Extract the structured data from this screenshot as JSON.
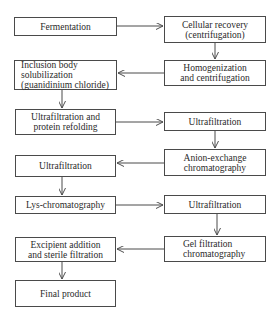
{
  "diagram": {
    "type": "flowchart",
    "nodes": [
      {
        "id": "fermentation",
        "label": "Fermentation"
      },
      {
        "id": "cellular_recovery",
        "label": "Cellular recovery\n(centrifugation)"
      },
      {
        "id": "homogenization",
        "label": "Homogenization\nand centrifugation"
      },
      {
        "id": "inclusion_body",
        "label": "Inclusion body\nsolubilization\n(guanidinium chloride)"
      },
      {
        "id": "uf_refolding",
        "label": "Ultrafiltration and\nprotein refolding"
      },
      {
        "id": "uf_2",
        "label": "Ultrafiltration"
      },
      {
        "id": "anion_exchange",
        "label": "Anion-exchange\nchromatography"
      },
      {
        "id": "uf_3",
        "label": "Ultrafiltration"
      },
      {
        "id": "lys_chrom",
        "label": "Lys-chromatography"
      },
      {
        "id": "uf_4",
        "label": "Ultrafiltration"
      },
      {
        "id": "gel_filtration",
        "label": "Gel filtration\nchromatography"
      },
      {
        "id": "excipient",
        "label": "Excipient addition\nand sterile filtration"
      },
      {
        "id": "final_product",
        "label": "Final product"
      }
    ],
    "edges": [
      [
        "fermentation",
        "cellular_recovery"
      ],
      [
        "cellular_recovery",
        "homogenization"
      ],
      [
        "homogenization",
        "inclusion_body"
      ],
      [
        "inclusion_body",
        "uf_refolding"
      ],
      [
        "uf_refolding",
        "uf_2"
      ],
      [
        "uf_2",
        "anion_exchange"
      ],
      [
        "anion_exchange",
        "uf_3"
      ],
      [
        "uf_3",
        "lys_chrom"
      ],
      [
        "lys_chrom",
        "uf_4"
      ],
      [
        "uf_4",
        "gel_filtration"
      ],
      [
        "gel_filtration",
        "excipient"
      ],
      [
        "excipient",
        "final_product"
      ]
    ]
  }
}
